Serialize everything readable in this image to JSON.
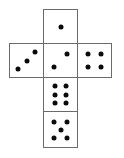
{
  "figure": {
    "kind": "dice-net-diagram",
    "background_color": "#ffffff",
    "stroke_color": "#6b6b6b",
    "pip_color": "#0a0a0a",
    "cell_size": 35,
    "pip_diameter": 5
  },
  "faces": [
    {
      "id": "face-top",
      "name": "top-face",
      "value": 1,
      "grid_col": 1,
      "grid_row": 0,
      "x": 43,
      "y": 9,
      "w": 35,
      "h": 35,
      "pattern": "center",
      "pips": [
        [
          50,
          50
        ]
      ]
    },
    {
      "id": "face-left",
      "name": "left-face",
      "value": 3,
      "grid_col": 0,
      "grid_row": 1,
      "x": 9,
      "y": 43,
      "w": 35,
      "h": 35,
      "pattern": "ascending-diagonal",
      "pips": [
        [
          24,
          76
        ],
        [
          50,
          50
        ],
        [
          76,
          24
        ]
      ]
    },
    {
      "id": "face-center",
      "name": "center-face",
      "value": 2,
      "grid_col": 1,
      "grid_row": 1,
      "x": 43,
      "y": 43,
      "w": 35,
      "h": 35,
      "pattern": "anti-diagonal",
      "pips": [
        [
          70,
          30
        ],
        [
          30,
          70
        ]
      ]
    },
    {
      "id": "face-right",
      "name": "right-face",
      "value": 4,
      "grid_col": 2,
      "grid_row": 1,
      "x": 77,
      "y": 43,
      "w": 35,
      "h": 35,
      "pattern": "four-corners",
      "pips": [
        [
          30,
          30
        ],
        [
          70,
          30
        ],
        [
          30,
          70
        ],
        [
          70,
          70
        ]
      ]
    },
    {
      "id": "face-lower",
      "name": "lower-center-face",
      "value": 6,
      "grid_col": 1,
      "grid_row": 2,
      "x": 43,
      "y": 77,
      "w": 35,
      "h": 35,
      "pattern": "two-columns-of-three",
      "pips": [
        [
          32,
          25
        ],
        [
          68,
          25
        ],
        [
          32,
          50
        ],
        [
          68,
          50
        ],
        [
          32,
          75
        ],
        [
          68,
          75
        ]
      ]
    },
    {
      "id": "face-bottom",
      "name": "bottom-face",
      "value": 5,
      "grid_col": 1,
      "grid_row": 3,
      "x": 43,
      "y": 111,
      "w": 35,
      "h": 37,
      "pattern": "four-corners-plus-center",
      "pips": [
        [
          30,
          28
        ],
        [
          70,
          28
        ],
        [
          50,
          50
        ],
        [
          30,
          74
        ],
        [
          70,
          74
        ]
      ]
    }
  ]
}
